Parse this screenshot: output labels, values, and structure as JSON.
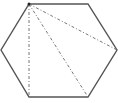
{
  "diagram": {
    "shape": "regular hexagon",
    "background": "#ffffff",
    "stroke_color": "#555555",
    "dash_color": "#777777",
    "vertices": [
      [
        29,
        4
      ],
      [
        88,
        4
      ],
      [
        117,
        50
      ],
      [
        88,
        97
      ],
      [
        29,
        97
      ],
      [
        1,
        50
      ]
    ],
    "diagonals_from": [
      29,
      4
    ],
    "diagonals_to": [
      [
        117,
        50
      ],
      [
        88,
        97
      ],
      [
        29,
        97
      ]
    ]
  }
}
